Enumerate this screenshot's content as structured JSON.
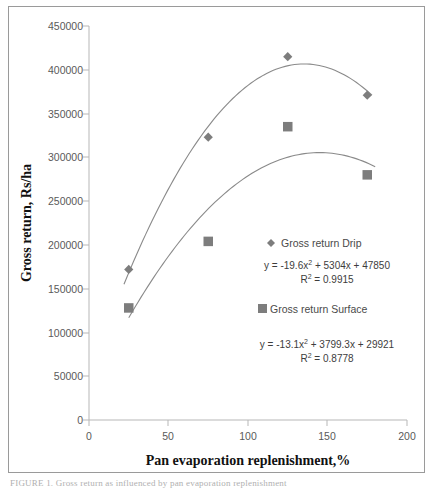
{
  "chart_data": {
    "type": "scatter",
    "title": "",
    "xlabel": "Pan evaporation replenishment,%",
    "ylabel": "Gross return, Rs/ha",
    "xlim": [
      0,
      200
    ],
    "ylim": [
      0,
      450000
    ],
    "xticks": [
      "0",
      "50",
      "100",
      "150",
      "200"
    ],
    "yticks": [
      "0",
      "50000",
      "100000",
      "150000",
      "200000",
      "250000",
      "300000",
      "350000",
      "400000",
      "450000"
    ],
    "grid": false,
    "legend_position": "inside-right",
    "x": [
      25,
      75,
      125,
      175
    ],
    "series": [
      {
        "name": "Gross return Drip",
        "marker": "diamond",
        "color": "#7d7d7d",
        "values": [
          172000,
          323000,
          415000,
          371000
        ],
        "fit_equation": "y = -19.6x² + 5304x + 47850",
        "fit_r2": "R² = 0.9915",
        "fit_coefficients": [
          -19.6,
          5304,
          47850
        ],
        "r_squared": 0.9915
      },
      {
        "name": "Gross return Surface",
        "marker": "square",
        "color": "#7d7d7d",
        "values": [
          128000,
          204000,
          335000,
          280000
        ],
        "fit_equation": "y = -13.1x² + 3799.3x + 29921",
        "fit_r2": "R² = 0.8778",
        "fit_coefficients": [
          -13.1,
          3799.3,
          29921
        ],
        "r_squared": 0.8778
      }
    ]
  },
  "axes": {
    "y_title": "Gross return, Rs/ha",
    "x_title": "Pan evaporation replenishment,%"
  },
  "legend": {
    "drip": {
      "label": "Gross return Drip",
      "marker": "diamond-marker"
    },
    "surface": {
      "label": "Gross return Surface",
      "marker": "square-marker"
    }
  },
  "equations": {
    "drip": {
      "prefix": "y = -19.6x",
      "exp": "2",
      "suffix": " + 5304x + 47850",
      "r2_prefix": "R",
      "r2_exp": "2",
      "r2_suffix": " = 0.9915"
    },
    "surface": {
      "prefix": "y = -13.1x",
      "exp": "2",
      "suffix": " + 3799.3x + 29921",
      "r2_prefix": "R",
      "r2_exp": "2",
      "r2_suffix": " = 0.8778"
    }
  },
  "caption": "FIGURE 1. Gross return as influenced by pan evaporation replenishment"
}
